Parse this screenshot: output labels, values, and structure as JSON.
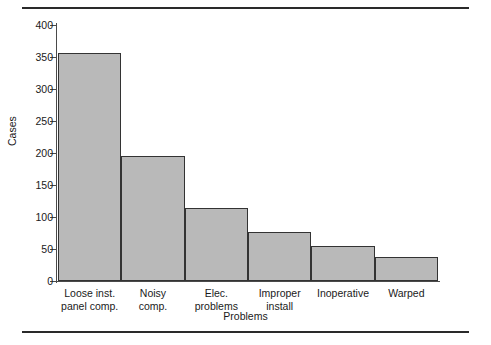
{
  "chart_data": {
    "type": "bar",
    "title": "",
    "subtitle": "",
    "categories": [
      "Loose inst.\npanel comp.",
      "Noisy\ncomp.",
      "Elec.\nproblems",
      "Improper\ninstall",
      "Inoperative",
      "Warped"
    ],
    "values": [
      357,
      196,
      114,
      76,
      55,
      38
    ],
    "xlabel": "Problems",
    "ylabel": "Cases",
    "ylim": [
      0,
      400
    ],
    "yticks": [
      0,
      50,
      100,
      150,
      200,
      250,
      300,
      350,
      400
    ],
    "ytick_labels": [
      "0",
      "50",
      "100",
      "150",
      "200",
      "250",
      "300",
      "350",
      "400"
    ],
    "grid": false,
    "legend": null,
    "bar_fill_color": "#b9b9b9",
    "bar_edge_color": "#333333",
    "axis_color": "#4a4a4a",
    "text_color": "#1a1a1a"
  }
}
